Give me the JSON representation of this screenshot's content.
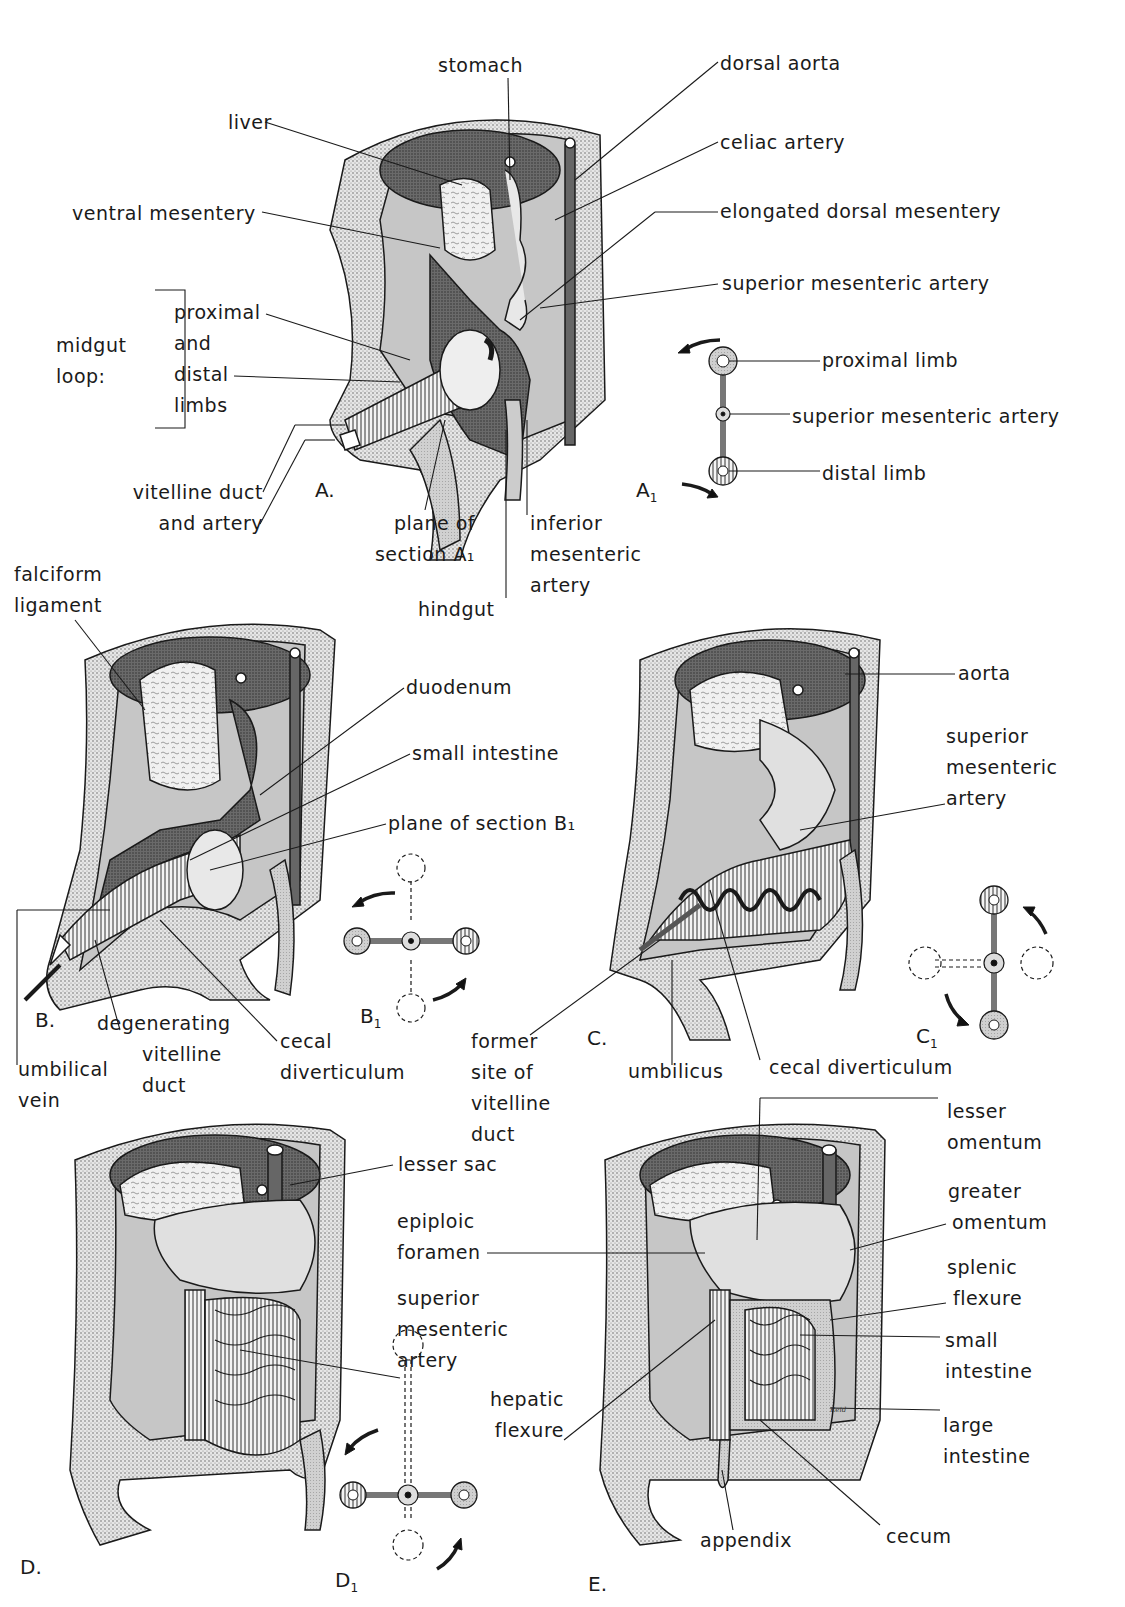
{
  "figure": {
    "panels": [
      {
        "id": "A",
        "label": "A."
      },
      {
        "id": "A1",
        "label": "A",
        "sub": "1"
      },
      {
        "id": "B",
        "label": "B."
      },
      {
        "id": "B1",
        "label": "B",
        "sub": "1"
      },
      {
        "id": "C",
        "label": "C."
      },
      {
        "id": "C1",
        "label": "C",
        "sub": "1"
      },
      {
        "id": "D",
        "label": "D."
      },
      {
        "id": "D1",
        "label": "D",
        "sub": "1"
      },
      {
        "id": "E",
        "label": "E."
      }
    ],
    "signature": "Reid"
  },
  "panel_a": {
    "labels": {
      "stomach": "stomach",
      "dorsal_aorta": "dorsal aorta",
      "liver": "liver",
      "celiac_artery": "celiac artery",
      "ventral_mesentery": "ventral mesentery",
      "elongated_dorsal_mesentery": "elongated dorsal mesentery",
      "superior_mesenteric_artery": "superior mesenteric artery",
      "midgut_loop": [
        "midgut",
        "loop:"
      ],
      "limbs": [
        "proximal",
        "and",
        "distal",
        "limbs"
      ],
      "vitelline_duct": [
        "vitelline duct",
        "and artery"
      ],
      "plane_of_section": [
        "plane of",
        "section A₁"
      ],
      "inferior_mesenteric_artery": [
        "inferior",
        "mesenteric",
        "artery"
      ],
      "hindgut": "hindgut"
    }
  },
  "panel_a1": {
    "labels": {
      "proximal_limb": "proximal limb",
      "superior_mesenteric_artery": "superior mesenteric artery",
      "distal_limb": "distal limb"
    }
  },
  "panel_b": {
    "labels": {
      "falciform_ligament": [
        "falciform",
        "ligament"
      ],
      "duodenum": "duodenum",
      "small_intestine": "small intestine",
      "plane_of_section": "plane of section B₁",
      "umbilical_vein": [
        "umbilical",
        "vein"
      ],
      "degenerating_vitelline_duct": [
        "degenerating",
        "vitelline",
        "duct"
      ],
      "cecal_diverticulum": [
        "cecal",
        "diverticulum"
      ]
    }
  },
  "panel_c": {
    "labels": {
      "aorta": "aorta",
      "superior_mesenteric_artery": [
        "superior",
        "mesenteric",
        "artery"
      ],
      "former_site": [
        "former",
        "site of",
        "vitelline",
        "duct"
      ],
      "umbilicus": "umbilicus",
      "cecal_diverticulum": "cecal diverticulum"
    }
  },
  "panel_d": {
    "labels": {
      "lesser_sac": "lesser sac",
      "superior_mesenteric_artery": [
        "superior",
        "mesenteric",
        "artery"
      ]
    }
  },
  "panel_e": {
    "labels": {
      "lesser_omentum": [
        "lesser",
        "omentum"
      ],
      "epiploic_foramen": [
        "epiploic",
        "foramen"
      ],
      "greater_omentum": [
        "greater",
        "omentum"
      ],
      "splenic_flexure": [
        "splenic",
        "flexure"
      ],
      "small_intestine": [
        "small",
        "intestine"
      ],
      "hepatic_flexure": [
        "hepatic",
        "flexure"
      ],
      "large_intestine": [
        "large",
        "intestine"
      ],
      "appendix": "appendix",
      "cecum": "cecum"
    }
  },
  "colors": {
    "ink": "#1a1a1a",
    "stipple_light": "#d8d8d8",
    "stipple_mid": "#a9a9a9",
    "stipple_dark": "#5a5a5a",
    "background": "#ffffff"
  }
}
